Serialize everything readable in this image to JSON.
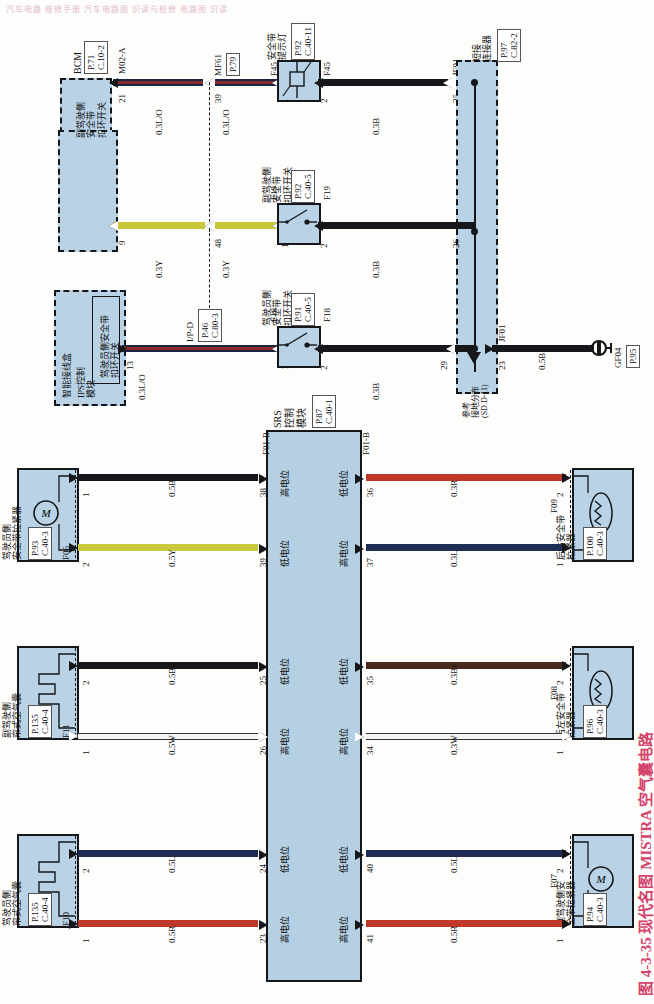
{
  "header": {
    "text": "汽车电路 维修手册  汽车电路图 识读与检修  电路图 识读"
  },
  "figure": {
    "caption": "图 4-3-35  现代名图 MISTRA 空气囊电路"
  },
  "top_section": {
    "bcm": {
      "label": "BCM",
      "page": "P.71",
      "conn": "C.10-2",
      "inner_label": "SBR\n垫",
      "pin": "21",
      "wire_code": "M02-A"
    },
    "mf61": {
      "label": "MF61",
      "page": "P.79",
      "pin": "39"
    },
    "sbr_wires": [
      {
        "color_code": "0.3L/O"
      },
      {
        "color_code": "0.3L/O"
      }
    ],
    "seatbelt_lamp": {
      "title": "安全带\n提示灯",
      "page": "P.92",
      "conn": "C.40-11",
      "pin_left": "1",
      "pin_right": "2",
      "conn_left": "F45",
      "conn_right": "F45",
      "out_wire": "0.3B",
      "out_pin": "25",
      "out_conn": "JF01"
    },
    "short_connector": {
      "title": "短接\n连接器",
      "page": "P.97",
      "conn": "C.82-2"
    },
    "passenger_buckle_switch": {
      "group_label": "副驾驶侧\n安全带\n扣环开关",
      "title": "副驾驶侧\n安全带\n扣环开关",
      "page": "P.92",
      "conn": "C.40-5",
      "pin_left": "1",
      "pin_right": "2",
      "conn_left": "F19",
      "conn_right": "F19",
      "group_pin": "9",
      "mid_pin": "48",
      "wire_in_a": "0.3Y",
      "wire_in_b": "0.3Y",
      "out_wire": "0.3B",
      "out_pin": "26"
    },
    "driver_buckle_switch": {
      "group_label": "智能接线盒",
      "module_label": "IPS控制\n模块",
      "inner_label": "驾驶员侧安全带\n扣环开关",
      "title": "驾驶员侧\n安全带\n扣环开关",
      "page": "P.91",
      "conn": "C.40-5",
      "pin_left": "1",
      "pin_right": "2",
      "conn_left": "F18",
      "conn_right": "F18",
      "group_pin": "13",
      "wire_code": "I/P-D",
      "wire_page": "P.46",
      "wire_conn": "C.80-3",
      "wire_in": "0.3L/O",
      "out_wire": "0.3B",
      "out_pin": "29"
    },
    "ground_ref": {
      "note": "参考\n接地分布\n(SD.D-11)",
      "pin": "23",
      "conn": "JF01",
      "wire": "0.5B",
      "gnd_label": "GF04",
      "gnd_page": "P.95"
    }
  },
  "srs": {
    "title": "SRS\n控制\n模块",
    "page": "P.87",
    "conn": "C.40-1",
    "conn_top_left": "F01-B",
    "conn_top_right": "F01-B",
    "left_pins": [
      {
        "pin": "38",
        "potential": "高电位"
      },
      {
        "pin": "39",
        "potential": "低电位"
      },
      {
        "pin": "25",
        "potential": "低电位"
      },
      {
        "pin": "26",
        "potential": "高电位"
      },
      {
        "pin": "24",
        "potential": "低电位"
      },
      {
        "pin": "23",
        "potential": "高电位"
      }
    ],
    "right_pins": [
      {
        "pin": "36",
        "potential": "低电位"
      },
      {
        "pin": "37",
        "potential": "高电位"
      },
      {
        "pin": "35",
        "potential": "低电位"
      },
      {
        "pin": "34",
        "potential": "高电位"
      },
      {
        "pin": "40",
        "potential": "低电位"
      },
      {
        "pin": "41",
        "potential": "高电位"
      }
    ]
  },
  "devices": {
    "driver_pretensioner": {
      "title": "驾驶员侧\n安全带拉紧器",
      "page": "P.93",
      "conn": "C.40-3",
      "connector": "F06",
      "pin_top": "1",
      "pin_bottom": "2",
      "symbol": "M",
      "wire_top": "0.5B",
      "wire_bottom": "0.5Y"
    },
    "passenger_curtain_airbag": {
      "title": "副驾驶侧\n帘式空气囊",
      "page": "P.135",
      "conn": "C.40-4",
      "connector": "F11",
      "pin_top": "2",
      "pin_bottom": "1",
      "wire_top": "0.5B",
      "wire_bottom": "0.5W"
    },
    "driver_curtain_airbag": {
      "title": "驾驶员侧\n帘式空气囊",
      "page": "P.135",
      "conn": "C.40-4",
      "connector": "F10",
      "pin_top": "2",
      "pin_bottom": "1",
      "wire_top": "0.5L",
      "wire_bottom": "0.5R"
    },
    "rear_right_pretensioner": {
      "title": "后右安全带\n拉紧器",
      "page": "P.100",
      "conn": "C.40-3",
      "connector": "F09",
      "pin_top": "2",
      "pin_bottom": "1",
      "wire_top": "0.3R",
      "wire_bottom": "0.3L"
    },
    "rear_left_pretensioner": {
      "title": "后左安全带\n拉紧器",
      "page": "P.96",
      "conn": "C.40-3",
      "connector": "F08",
      "pin_top": "2",
      "pin_bottom": "1",
      "wire_top": "0.3Br",
      "wire_bottom": "0.3W"
    },
    "passenger_pretensioner": {
      "title": "副驾驶侧安\n全带拉紧器",
      "page": "P.94",
      "conn": "C.40-3",
      "connector": "F07",
      "pin_top": "2",
      "pin_bottom": "1",
      "symbol": "M",
      "wire_top": "0.5L",
      "wire_bottom": "0.5R"
    }
  },
  "colors": {
    "black": "#15171a",
    "red": "#c0392b",
    "blue": "#1f2d52",
    "brown": "#4a2a1c",
    "yellow": "#c9c83c",
    "white": "#f2f2f2",
    "box_fill": "#b9d2e5",
    "caption": "#d4436a"
  }
}
